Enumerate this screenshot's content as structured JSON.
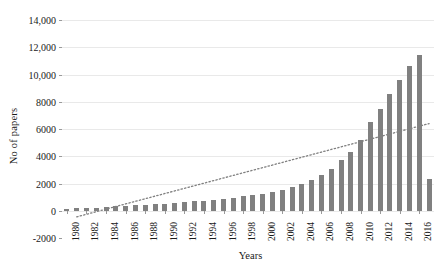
{
  "chart_data": {
    "type": "bar",
    "title": "",
    "xlabel": "Years",
    "ylabel": "No of papers",
    "grid": true,
    "legend": "none",
    "ylim": [
      -2000,
      14000
    ],
    "ytick_labels": [
      "14,000",
      "12,000",
      "10,000",
      "8000",
      "6000",
      "4000",
      "2000",
      "0",
      "-2000"
    ],
    "ytick_values": [
      14000,
      12000,
      10000,
      8000,
      6000,
      4000,
      2000,
      0,
      -2000
    ],
    "xtick_labels": [
      "1980",
      "1982",
      "1984",
      "1986",
      "1988",
      "1990",
      "1992",
      "1994",
      "1996",
      "1998",
      "2000",
      "2002",
      "2004",
      "2006",
      "2008",
      "2010",
      "2012",
      "2014",
      "2016"
    ],
    "categories": [
      1980,
      1981,
      1982,
      1983,
      1984,
      1985,
      1986,
      1987,
      1988,
      1989,
      1990,
      1991,
      1992,
      1993,
      1994,
      1995,
      1996,
      1997,
      1998,
      1999,
      2000,
      2001,
      2002,
      2003,
      2004,
      2005,
      2006,
      2007,
      2008,
      2009,
      2010,
      2011,
      2012,
      2013,
      2014,
      2015,
      2016,
      2017
    ],
    "values": [
      150,
      170,
      200,
      230,
      300,
      330,
      360,
      400,
      430,
      470,
      520,
      560,
      620,
      680,
      740,
      800,
      880,
      950,
      1050,
      1150,
      1250,
      1400,
      1550,
      1750,
      1950,
      2250,
      2600,
      3100,
      3700,
      4300,
      5200,
      6500,
      7500,
      8600,
      9600,
      10600,
      11400,
      2300
    ],
    "bar_color": "#808080",
    "trendline": {
      "style": "dotted",
      "color": "#808080",
      "x_start": 1981,
      "y_start": -450,
      "x_end": 2017,
      "y_end": 6400
    }
  }
}
